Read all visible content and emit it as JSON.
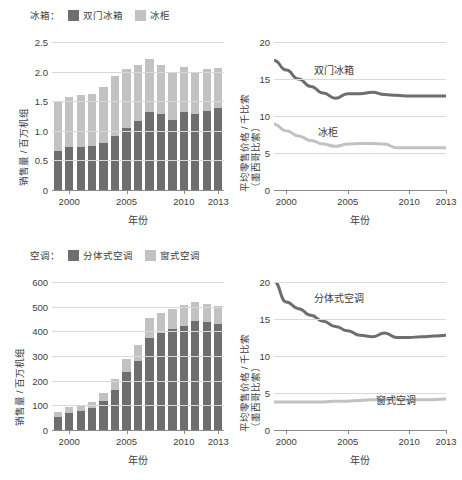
{
  "figure": {
    "colors": {
      "dark": "#6e6e6e",
      "light": "#c2c2c2",
      "grid": "#d9d9d9",
      "axis": "#8a8a8a",
      "text": "#3d3d3d"
    }
  },
  "panels": {
    "top_left": {
      "legend_title": "冰箱：",
      "legend": [
        {
          "label": "双门冰箱",
          "color": "#6e6e6e"
        },
        {
          "label": "冰柜",
          "color": "#c2c2c2"
        }
      ],
      "ylabel": "销售量 / 百万机组",
      "xlabel": "年份"
    },
    "top_right": {
      "ylabel_line1": "平均零售价格 / 千比索",
      "ylabel_line2": "（墨西哥比索）",
      "xlabel": "年份",
      "series_labels": [
        "双门冰箱",
        "冰柜"
      ]
    },
    "bottom_left": {
      "legend_title": "空调：",
      "legend": [
        {
          "label": "分体式空调",
          "color": "#6e6e6e"
        },
        {
          "label": "窗式空调",
          "color": "#c2c2c2"
        }
      ],
      "ylabel": "销售量 / 百万机组",
      "xlabel": "年份"
    },
    "bottom_right": {
      "ylabel_line1": "平均零售价格 / 千比索",
      "ylabel_line2": "（墨西哥比索）",
      "xlabel": "年份",
      "series_labels": [
        "分体式空调",
        "窗式空调"
      ]
    }
  },
  "chart_data": [
    {
      "id": "refrigerator-sales",
      "type": "bar",
      "stacked": true,
      "title": "冰箱",
      "xlabel": "年份",
      "ylabel": "销售量 / 百万机组",
      "x": [
        1999,
        2000,
        2001,
        2002,
        2003,
        2004,
        2005,
        2006,
        2007,
        2008,
        2009,
        2010,
        2011,
        2012,
        2013
      ],
      "xticks": [
        2000,
        2005,
        2010,
        2013
      ],
      "ylim": [
        0,
        2.5
      ],
      "yticks": [
        0,
        0.5,
        1.0,
        1.5,
        2.0,
        2.5
      ],
      "ytick_labels": [
        "0",
        "0.5",
        "1.0",
        "1.5",
        "2.0",
        "2.5"
      ],
      "grid": true,
      "series": [
        {
          "name": "双门冰箱",
          "color": "#6e6e6e",
          "values": [
            0.66,
            0.72,
            0.73,
            0.74,
            0.79,
            0.92,
            1.05,
            1.16,
            1.31,
            1.29,
            1.18,
            1.31,
            1.28,
            1.34,
            1.38
          ]
        },
        {
          "name": "冰柜",
          "color": "#c2c2c2",
          "values": [
            0.85,
            0.85,
            0.87,
            0.88,
            0.95,
            1.0,
            0.99,
            0.95,
            0.91,
            0.83,
            0.8,
            0.77,
            0.69,
            0.71,
            0.68
          ]
        }
      ],
      "totals": [
        1.51,
        1.57,
        1.6,
        1.62,
        1.74,
        1.92,
        2.04,
        2.11,
        2.22,
        2.12,
        1.98,
        2.08,
        1.97,
        2.05,
        2.06
      ]
    },
    {
      "id": "refrigerator-price",
      "type": "line",
      "xlabel": "年份",
      "ylabel": "平均零售价格 / 千比索（墨西哥比索）",
      "x": [
        1999,
        2000,
        2001,
        2002,
        2003,
        2004,
        2005,
        2006,
        2007,
        2008,
        2009,
        2010,
        2011,
        2012,
        2013
      ],
      "xticks": [
        2000,
        2005,
        2010,
        2013
      ],
      "ylim": [
        0,
        20
      ],
      "yticks": [
        0,
        5,
        10,
        15,
        20
      ],
      "ytick_labels": [
        "0",
        "5",
        "10",
        "15",
        "20"
      ],
      "grid": true,
      "series": [
        {
          "name": "双门冰箱",
          "color": "#6e6e6e",
          "values": [
            17.5,
            16.2,
            15.0,
            14.0,
            13.1,
            12.4,
            13.0,
            13.0,
            13.2,
            12.9,
            12.8,
            12.7,
            12.7,
            12.7,
            12.7
          ]
        },
        {
          "name": "冰柜",
          "color": "#c2c2c2",
          "values": [
            8.9,
            8.0,
            7.3,
            6.7,
            6.2,
            5.9,
            6.2,
            6.3,
            6.3,
            6.2,
            5.7,
            5.7,
            5.7,
            5.7,
            5.7
          ]
        }
      ]
    },
    {
      "id": "air-conditioner-sales",
      "type": "bar",
      "stacked": true,
      "title": "空调",
      "xlabel": "年份",
      "ylabel": "销售量 / 百万机组",
      "x": [
        1999,
        2000,
        2001,
        2002,
        2003,
        2004,
        2005,
        2006,
        2007,
        2008,
        2009,
        2010,
        2011,
        2012,
        2013
      ],
      "xticks": [
        2000,
        2005,
        2010,
        2013
      ],
      "ylim": [
        0,
        600
      ],
      "yticks": [
        0,
        100,
        200,
        300,
        400,
        500,
        600
      ],
      "ytick_labels": [
        "0",
        "100",
        "200",
        "300",
        "400",
        "500",
        "600"
      ],
      "grid": true,
      "series": [
        {
          "name": "分体式空调",
          "color": "#6e6e6e",
          "values": [
            52,
            68,
            77,
            88,
            116,
            162,
            234,
            281,
            375,
            392,
            410,
            420,
            442,
            438,
            430
          ]
        },
        {
          "name": "窗式空调",
          "color": "#c2c2c2",
          "values": [
            23,
            25,
            23,
            27,
            35,
            43,
            53,
            65,
            81,
            82,
            80,
            85,
            78,
            74,
            73
          ]
        }
      ],
      "totals": [
        75,
        93,
        100,
        115,
        151,
        205,
        287,
        346,
        456,
        474,
        490,
        505,
        520,
        512,
        503
      ]
    },
    {
      "id": "air-conditioner-price",
      "type": "line",
      "xlabel": "年份",
      "ylabel": "平均零售价格 / 千比索（墨西哥比索）",
      "x": [
        1999,
        2000,
        2001,
        2002,
        2003,
        2004,
        2005,
        2006,
        2007,
        2008,
        2009,
        2010,
        2011,
        2012,
        2013
      ],
      "xticks": [
        2000,
        2005,
        2010,
        2013
      ],
      "ylim": [
        0,
        20
      ],
      "yticks": [
        0,
        5,
        10,
        15,
        20
      ],
      "ytick_labels": [
        "0",
        "5",
        "10",
        "15",
        "20"
      ],
      "grid": true,
      "series": [
        {
          "name": "分体式空调",
          "color": "#6e6e6e",
          "values": [
            20.1,
            17.3,
            16.4,
            15.5,
            14.7,
            14.0,
            13.4,
            12.8,
            12.6,
            13.1,
            12.5,
            12.5,
            12.6,
            12.7,
            12.8
          ]
        },
        {
          "name": "窗式空调",
          "color": "#c2c2c2",
          "values": [
            3.8,
            3.8,
            3.8,
            3.8,
            3.8,
            3.9,
            3.9,
            4.0,
            4.1,
            4.1,
            4.1,
            4.1,
            4.1,
            4.1,
            4.2
          ]
        }
      ]
    }
  ]
}
